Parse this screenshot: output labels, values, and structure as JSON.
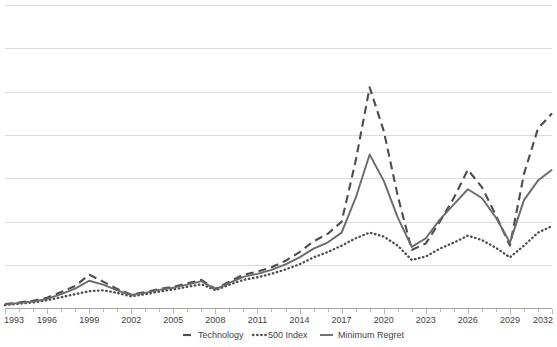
{
  "chart_data": {
    "type": "line",
    "title": "",
    "xlabel": "",
    "ylabel": "",
    "xlim": [
      1993,
      2032
    ],
    "ylim": [
      0,
      7
    ],
    "grid": true,
    "y_tick_labels": [],
    "legend_position": "bottom",
    "x_tick_labels": [
      "1993",
      "1996",
      "1999",
      "2002",
      "2005",
      "2008",
      "2011",
      "2014",
      "2017",
      "2020",
      "2023",
      "2026",
      "2029",
      "2032"
    ],
    "x": [
      1993,
      1994,
      1995,
      1996,
      1997,
      1998,
      1999,
      2000,
      2001,
      2002,
      2003,
      2004,
      2005,
      2006,
      2007,
      2008,
      2009,
      2010,
      2011,
      2012,
      2013,
      2014,
      2015,
      2016,
      2017,
      2018,
      2019,
      2020,
      2021,
      2022,
      2023,
      2024,
      2025,
      2026,
      2027,
      2028,
      2029,
      2030,
      2031,
      2032
    ],
    "series": [
      {
        "name": "Technology",
        "style": "dashed",
        "color": "#4c4c4c",
        "values": [
          0.1,
          0.14,
          0.18,
          0.25,
          0.38,
          0.52,
          0.78,
          0.62,
          0.45,
          0.32,
          0.38,
          0.45,
          0.5,
          0.58,
          0.66,
          0.45,
          0.62,
          0.78,
          0.85,
          0.95,
          1.1,
          1.3,
          1.55,
          1.72,
          2.0,
          3.4,
          5.1,
          4.1,
          2.6,
          1.35,
          1.5,
          2.0,
          2.55,
          3.2,
          2.8,
          2.15,
          1.45,
          3.1,
          4.15,
          4.5
        ]
      },
      {
        "name": "500 Index",
        "style": "dotted",
        "color": "#4c4c4c",
        "values": [
          0.08,
          0.11,
          0.14,
          0.19,
          0.26,
          0.33,
          0.4,
          0.42,
          0.36,
          0.28,
          0.33,
          0.39,
          0.44,
          0.5,
          0.56,
          0.42,
          0.55,
          0.66,
          0.72,
          0.8,
          0.9,
          1.02,
          1.18,
          1.3,
          1.45,
          1.62,
          1.75,
          1.66,
          1.45,
          1.12,
          1.2,
          1.38,
          1.52,
          1.68,
          1.58,
          1.4,
          1.18,
          1.45,
          1.75,
          1.9
        ]
      },
      {
        "name": "Minimum Regret",
        "style": "solid",
        "color": "#6a6a6a",
        "values": [
          0.09,
          0.13,
          0.16,
          0.22,
          0.33,
          0.46,
          0.64,
          0.55,
          0.42,
          0.31,
          0.36,
          0.43,
          0.48,
          0.55,
          0.63,
          0.44,
          0.59,
          0.73,
          0.8,
          0.89,
          1.02,
          1.18,
          1.38,
          1.52,
          1.75,
          2.55,
          3.55,
          2.95,
          2.1,
          1.42,
          1.62,
          2.05,
          2.4,
          2.75,
          2.55,
          2.1,
          1.52,
          2.5,
          2.95,
          3.2
        ]
      }
    ],
    "legend": [
      {
        "label": "Technology",
        "style": "dashed"
      },
      {
        "label": "500 Index",
        "style": "dotted"
      },
      {
        "label": "Minimum Regret",
        "style": "solid"
      }
    ],
    "colors": {
      "gridline": "#d3d3d3",
      "axis": "#9a9a9a",
      "text": "#3f3f3f",
      "series_dark": "#4c4c4c",
      "series_mid": "#6a6a6a",
      "background": "#ffffff"
    }
  }
}
